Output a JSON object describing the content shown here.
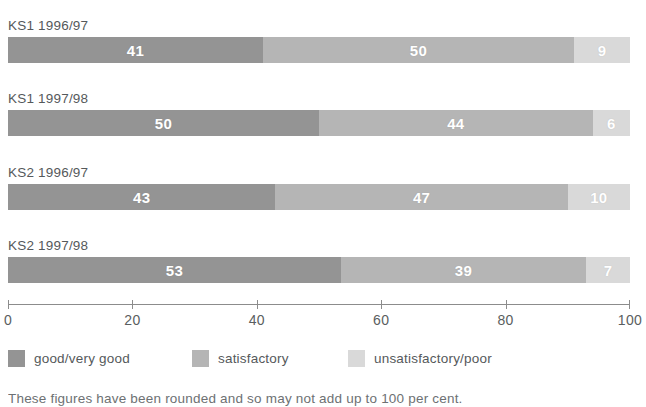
{
  "chart_data": {
    "type": "bar",
    "orientation": "horizontal",
    "stacked": true,
    "title": "",
    "xlabel": "",
    "ylabel": "",
    "xlim": [
      0,
      100
    ],
    "xticks": [
      0,
      20,
      40,
      60,
      80,
      100
    ],
    "xtick_labels": [
      "0",
      "20",
      "40",
      "60",
      "80",
      "100"
    ],
    "grid": false,
    "legend_position": "bottom-left",
    "categories": [
      "KS1 1996/97",
      "KS1 1997/98",
      "KS2 1996/97",
      "KS2 1997/98"
    ],
    "series": [
      {
        "name": "good/very good",
        "color": "#949494",
        "values": [
          41,
          50,
          43,
          53
        ]
      },
      {
        "name": "satisfactory",
        "color": "#b5b5b5",
        "values": [
          50,
          44,
          47,
          39
        ]
      },
      {
        "name": "unsatisfactory/poor",
        "color": "#d9d9d9",
        "values": [
          9,
          6,
          10,
          7
        ]
      }
    ]
  },
  "rows": [
    {
      "label": "KS1 1996/97",
      "segments": [
        {
          "value": 41,
          "display": "41",
          "color": "#949494",
          "series": "good/very good"
        },
        {
          "value": 50,
          "display": "50",
          "color": "#b5b5b5",
          "series": "satisfactory"
        },
        {
          "value": 9,
          "display": "9",
          "color": "#d9d9d9",
          "series": "unsatisfactory/poor"
        }
      ]
    },
    {
      "label": "KS1 1997/98",
      "segments": [
        {
          "value": 50,
          "display": "50",
          "color": "#949494",
          "series": "good/very good"
        },
        {
          "value": 44,
          "display": "44",
          "color": "#b5b5b5",
          "series": "satisfactory"
        },
        {
          "value": 6,
          "display": "6",
          "color": "#d9d9d9",
          "series": "unsatisfactory/poor"
        }
      ]
    },
    {
      "label": "KS2 1996/97",
      "segments": [
        {
          "value": 43,
          "display": "43",
          "color": "#949494",
          "series": "good/very good"
        },
        {
          "value": 47,
          "display": "47",
          "color": "#b5b5b5",
          "series": "satisfactory"
        },
        {
          "value": 10,
          "display": "10",
          "color": "#d9d9d9",
          "series": "unsatisfactory/poor"
        }
      ]
    },
    {
      "label": "KS2 1997/98",
      "segments": [
        {
          "value": 53,
          "display": "53",
          "color": "#949494",
          "series": "good/very good"
        },
        {
          "value": 39,
          "display": "39",
          "color": "#b5b5b5",
          "series": "satisfactory"
        },
        {
          "value": 7,
          "display": "7",
          "color": "#d9d9d9",
          "series": "unsatisfactory/poor"
        }
      ]
    }
  ],
  "axis": {
    "ticks": [
      {
        "value": 0,
        "label": "0"
      },
      {
        "value": 20,
        "label": "20"
      },
      {
        "value": 40,
        "label": "40"
      },
      {
        "value": 60,
        "label": "60"
      },
      {
        "value": 80,
        "label": "80"
      },
      {
        "value": 100,
        "label": "100"
      }
    ],
    "min": 0,
    "max": 100
  },
  "legend": {
    "items": [
      {
        "label": "good/very good",
        "color": "#949494",
        "left": 0
      },
      {
        "label": "satisfactory",
        "color": "#b5b5b5",
        "left": 184
      },
      {
        "label": "unsatisfactory/poor",
        "color": "#d9d9d9",
        "left": 340
      }
    ]
  },
  "caption": {
    "text": "These figures have been rounded and so may not add up to 100 per cent."
  },
  "colors": {
    "good": "#949494",
    "satisfactory": "#b5b5b5",
    "unsatisfactory": "#d9d9d9",
    "text": "#55595b",
    "axis": "#8c8c8c",
    "background": "#ffffff"
  }
}
